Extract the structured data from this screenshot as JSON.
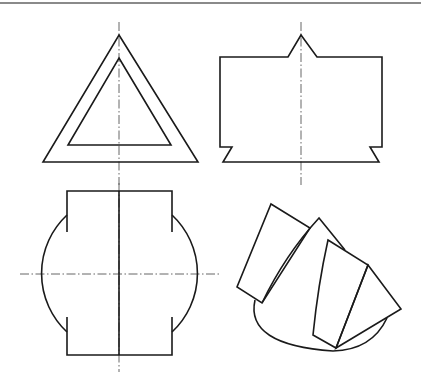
{
  "drawing": {
    "type": "orthographic-projection-exercise",
    "colors": {
      "line": "#1a1a1a",
      "centerline": "#555555",
      "rule": "#8a8a8a",
      "background": "#ffffff"
    },
    "views": [
      {
        "id": "front-view-triangle",
        "description": "Hollow equilateral triangle (outer and inner triangle)",
        "outer_triangle": "119,35 198,162 43,162",
        "inner_triangle": "119,58 171,145 68,145",
        "centerline": {
          "x1": 119,
          "y1": 22,
          "x2": 119,
          "y2": 185
        }
      },
      {
        "id": "side-view-block",
        "description": "Rectangular block with V-peak on top and dovetail notches at bottom",
        "outline": "220,57 288,57 301,35 317,57 382,57 382,147 370,147 379,162 223,162 232,147 220,147",
        "centerline": {
          "x1": 301,
          "y1": 22,
          "x2": 301,
          "y2": 185
        }
      },
      {
        "id": "top-view-cylinder",
        "description": "Rectangle intersected by circle with arc segments",
        "rect": {
          "x1": 67,
          "y1": 191,
          "x2": 172,
          "y2": 355
        },
        "left_arc": "M67,215 A80,80 0 0,0 67,332",
        "right_arc": "M172,215 A80,80 0 0,1 172,332",
        "gaps": {
          "top_segment_end": 232,
          "bottom_segment_start": 317
        },
        "center_solid": {
          "x1": 119,
          "y1": 191,
          "x2": 119,
          "y2": 355
        },
        "centerline_v": {
          "x1": 119,
          "y1": 183,
          "x2": 119,
          "y2": 372
        },
        "centerline_h": {
          "x1": 20,
          "y1": 274,
          "x2": 220,
          "y2": 274
        }
      },
      {
        "id": "isometric-view-fan",
        "description": "Fanned panels over an elliptical base",
        "panel_1": "271,204 310,228 262,303 237,287",
        "panel_2": "M262,303 Q285,255 319,218 L345,250",
        "panel_3": "M328,240 L368,265 L336,348 L313,335 Q318,285 328,240 Z",
        "panel_4": "368,265 401,309 336,348",
        "ellipse_arc": "M255,300 Q245,345 333,351 Q372,350 387,318"
      }
    ]
  }
}
